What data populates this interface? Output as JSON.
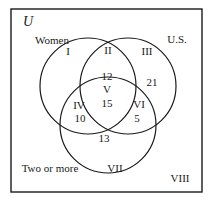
{
  "figure": {
    "kind": "venn-diagram",
    "universe_label": "U",
    "stroke_color": "#1a1a1a",
    "background_color": "#ffffff",
    "rectangle": {
      "x": 11,
      "y": 9,
      "width": 191,
      "height": 183
    },
    "circles": [
      {
        "name": "women",
        "cx": 88,
        "cy": 86,
        "r": 48
      },
      {
        "name": "us",
        "cx": 128,
        "cy": 86,
        "r": 48
      },
      {
        "name": "two-or-more",
        "cx": 108,
        "cy": 125,
        "r": 48
      }
    ],
    "set_labels": [
      {
        "id": "women",
        "text": "Women",
        "x": 52,
        "y": 40
      },
      {
        "id": "us",
        "text": "U.S.",
        "x": 177,
        "y": 39
      },
      {
        "id": "two-or-more",
        "text": "Two or more",
        "x": 50,
        "y": 168
      }
    ],
    "region_labels": [
      {
        "id": "I",
        "text": "I",
        "x": 68,
        "y": 51
      },
      {
        "id": "II",
        "text": "II",
        "x": 108,
        "y": 50
      },
      {
        "id": "III",
        "text": "III",
        "x": 147,
        "y": 51
      },
      {
        "id": "IV",
        "text": "IV",
        "x": 79,
        "y": 105
      },
      {
        "id": "V",
        "text": "V",
        "x": 107,
        "y": 89
      },
      {
        "id": "VI",
        "text": "VI",
        "x": 139,
        "y": 104
      },
      {
        "id": "VII",
        "text": "VII",
        "x": 115,
        "y": 168
      },
      {
        "id": "VIII",
        "text": "VIII",
        "x": 180,
        "y": 178
      }
    ],
    "counts": [
      {
        "id": "women-and-us",
        "value": "12",
        "x": 107,
        "y": 76
      },
      {
        "id": "us-only-inner",
        "value": "21",
        "x": 152,
        "y": 82
      },
      {
        "id": "all-three",
        "value": "15",
        "x": 107,
        "y": 103
      },
      {
        "id": "women-and-two-or-more",
        "value": "10",
        "x": 80,
        "y": 118
      },
      {
        "id": "us-and-two-or-more",
        "value": "5",
        "x": 137,
        "y": 118
      },
      {
        "id": "two-or-more-inner",
        "value": "13",
        "x": 104,
        "y": 138
      }
    ]
  }
}
